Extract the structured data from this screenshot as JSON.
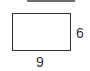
{
  "diagram": {
    "shape": "rectangle",
    "height_label": "6",
    "width_label": "9"
  }
}
